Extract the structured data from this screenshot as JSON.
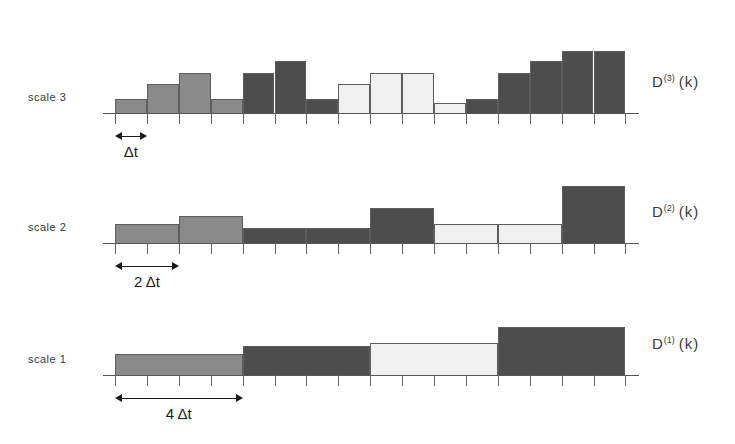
{
  "figure": {
    "background": "#ffffff",
    "axis_color": "#555555",
    "bar_border": "#5d5d5d"
  },
  "palette": {
    "medium_gray": "#8a8a8a",
    "dark_gray": "#4d4d4d",
    "light_gray": "#f0f0f0",
    "arrow": "#1b1b1b"
  },
  "rows": [
    {
      "id": "scale-3",
      "left_label": "scale 3",
      "right_label_base": "D",
      "right_label_sup": "(3)",
      "right_label_arg": "(k)",
      "annotation": {
        "label": "Δt",
        "span_intervals": 1
      },
      "n_ticks": 17
    },
    {
      "id": "scale-2",
      "left_label": "scale 2",
      "right_label_base": "D",
      "right_label_sup": "(2)",
      "right_label_arg": "(k)",
      "annotation": {
        "label": "2 Δt",
        "span_intervals": 2
      },
      "n_ticks": 17
    },
    {
      "id": "scale-1",
      "left_label": "scale 1",
      "right_label_base": "D",
      "right_label_sup": "(1)",
      "right_label_arg": "(k)",
      "annotation": {
        "label": "4 Δt",
        "span_intervals": 4
      },
      "n_ticks": 17
    }
  ],
  "chart_data": {
    "type": "bar",
    "xlabel": "",
    "ylabel": "",
    "x_unit": "Δt",
    "x_total_intervals": 16,
    "grid": false,
    "legend": "none",
    "shade_legend": {
      "medium_gray": "first quarter segment",
      "dark_gray": "second and fourth quarter segments",
      "light_gray": "third quarter segment"
    },
    "series": [
      {
        "name": "D (3) (k)",
        "scale": 3,
        "bar_width_intervals": 1,
        "categories": [
          1,
          2,
          3,
          4,
          5,
          6,
          7,
          8,
          9,
          10,
          11,
          12,
          13,
          14,
          15,
          16
        ],
        "values": [
          22,
          46,
          64,
          22,
          64,
          84,
          22,
          46,
          64,
          64,
          16,
          22,
          64,
          84,
          100,
          100
        ],
        "shades": [
          "medium_gray",
          "medium_gray",
          "medium_gray",
          "medium_gray",
          "dark_gray",
          "dark_gray",
          "dark_gray",
          "light_gray",
          "light_gray",
          "light_gray",
          "light_gray",
          "dark_gray",
          "dark_gray",
          "dark_gray",
          "dark_gray",
          "dark_gray"
        ],
        "ylim": [
          0,
          110
        ]
      },
      {
        "name": "D (2) (k)",
        "scale": 2,
        "bar_width_intervals": 2,
        "categories": [
          1,
          3,
          5,
          7,
          9,
          11,
          13,
          15
        ],
        "values": [
          30,
          44,
          24,
          24,
          56,
          30,
          30,
          92
        ],
        "shades": [
          "medium_gray",
          "medium_gray",
          "dark_gray",
          "dark_gray",
          "dark_gray",
          "light_gray",
          "light_gray",
          "dark_gray"
        ],
        "ylim": [
          0,
          110
        ]
      },
      {
        "name": "D (1) (k)",
        "scale": 1,
        "bar_width_intervals": 4,
        "categories": [
          1,
          5,
          9,
          13
        ],
        "values": [
          34,
          46,
          52,
          78
        ],
        "shades": [
          "medium_gray",
          "dark_gray",
          "light_gray",
          "dark_gray"
        ],
        "ylim": [
          0,
          110
        ]
      }
    ]
  }
}
